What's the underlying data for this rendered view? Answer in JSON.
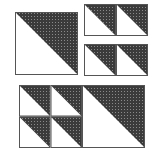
{
  "diagram": {
    "title": "",
    "colors": {
      "background": "#ffffff",
      "dark_fill": "#3b3b3b",
      "dot": "#8a8a8a",
      "outline": "#555555",
      "light_fill": "#ffffff"
    },
    "units": [
      {
        "id": "large-top-left",
        "x": 15,
        "y": 12,
        "size": 63
      },
      {
        "id": "small-r1-c1",
        "x": 84,
        "y": 4,
        "size": 32
      },
      {
        "id": "small-r1-c2",
        "x": 116,
        "y": 4,
        "size": 32
      },
      {
        "id": "small-r2-c1",
        "x": 84,
        "y": 44,
        "size": 32
      },
      {
        "id": "small-r2-c2",
        "x": 116,
        "y": 44,
        "size": 32
      },
      {
        "id": "bottom-small-r1-c1",
        "x": 19,
        "y": 85,
        "size": 31.5
      },
      {
        "id": "bottom-small-r1-c2",
        "x": 50.5,
        "y": 85,
        "size": 31.5
      },
      {
        "id": "bottom-small-r2-c1",
        "x": 19,
        "y": 116.5,
        "size": 31.5
      },
      {
        "id": "bottom-small-r2-c2",
        "x": 50.5,
        "y": 116.5,
        "size": 31.5
      },
      {
        "id": "bottom-large",
        "x": 82,
        "y": 85,
        "size": 63
      }
    ]
  }
}
